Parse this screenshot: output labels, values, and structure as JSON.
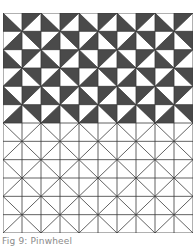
{
  "figure": {
    "caption": "Fig 9: Pinwheel",
    "grid": {
      "cols": 10,
      "rows": 12,
      "filled_rows": 6
    },
    "pattern": {
      "name": "pinwheel",
      "block_size": 2,
      "dark_triangles": {
        "top_left_cell": "lower-left",
        "top_right_cell": "upper-left",
        "bottom_left_cell": "lower-right",
        "bottom_right_cell": "upper-right"
      }
    },
    "colors": {
      "fill": "#4a4a4a",
      "line": "#3a3a3a",
      "background": "#ffffff",
      "caption": "#8a8a8a"
    }
  }
}
